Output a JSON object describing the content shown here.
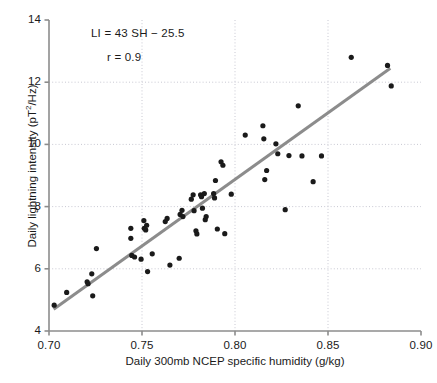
{
  "chart_data": {
    "type": "scatter",
    "title": "",
    "xlabel": "Daily 300mb NCEP specific humidity (g/kg)",
    "ylabel": "Daily lightning intensity (pT²/Hz)",
    "ylabel_main": "Daily lightning intensity (pT",
    "ylabel_sup": "2",
    "ylabel_tail": "/Hz)",
    "xlim": [
      0.7,
      0.9
    ],
    "ylim": [
      4,
      14
    ],
    "xticks": [
      0.7,
      0.75,
      0.8,
      0.85,
      0.9
    ],
    "xtick_labels": [
      "0.70",
      "0.75",
      "0.80",
      "0.85",
      "0.90"
    ],
    "yticks": [
      4,
      6,
      8,
      10,
      12,
      14
    ],
    "ytick_labels": [
      "4",
      "6",
      "8",
      "10",
      "12",
      "14"
    ],
    "grid": true,
    "grid_style": "dotted",
    "legend": "none",
    "annotations": [
      {
        "text": "LI = 43 SH − 25.5",
        "x": 0.745,
        "y": 13.3
      },
      {
        "text": "r = 0.9",
        "x": 0.754,
        "y": 12.5
      }
    ],
    "fit_line": {
      "equation": "LI = 43 SH − 25.5",
      "slope": 43,
      "intercept": -25.5,
      "correlation": 0.9,
      "x_start": 0.7025,
      "y_start": 4.7,
      "x_end": 0.8835,
      "y_end": 12.45,
      "color": "#8c8c8c",
      "width": 3
    },
    "point_color": "#1a1a1a",
    "point_radius": 2.6,
    "points": [
      {
        "x": 0.7028,
        "y": 4.83
      },
      {
        "x": 0.7095,
        "y": 5.24
      },
      {
        "x": 0.7205,
        "y": 5.58
      },
      {
        "x": 0.721,
        "y": 5.52
      },
      {
        "x": 0.723,
        "y": 5.84
      },
      {
        "x": 0.7235,
        "y": 5.13
      },
      {
        "x": 0.7255,
        "y": 6.65
      },
      {
        "x": 0.744,
        "y": 7.3
      },
      {
        "x": 0.7445,
        "y": 6.43
      },
      {
        "x": 0.744,
        "y": 6.98
      },
      {
        "x": 0.746,
        "y": 6.38
      },
      {
        "x": 0.7495,
        "y": 6.31
      },
      {
        "x": 0.751,
        "y": 7.55
      },
      {
        "x": 0.7512,
        "y": 7.3
      },
      {
        "x": 0.752,
        "y": 7.25
      },
      {
        "x": 0.7525,
        "y": 7.4
      },
      {
        "x": 0.753,
        "y": 5.91
      },
      {
        "x": 0.7555,
        "y": 6.48
      },
      {
        "x": 0.7625,
        "y": 7.52
      },
      {
        "x": 0.7635,
        "y": 7.62
      },
      {
        "x": 0.765,
        "y": 6.12
      },
      {
        "x": 0.77,
        "y": 6.34
      },
      {
        "x": 0.7705,
        "y": 7.75
      },
      {
        "x": 0.7715,
        "y": 7.88
      },
      {
        "x": 0.772,
        "y": 7.68
      },
      {
        "x": 0.7765,
        "y": 8.24
      },
      {
        "x": 0.7775,
        "y": 8.38
      },
      {
        "x": 0.778,
        "y": 7.87
      },
      {
        "x": 0.779,
        "y": 7.22
      },
      {
        "x": 0.7795,
        "y": 7.12
      },
      {
        "x": 0.7815,
        "y": 8.38
      },
      {
        "x": 0.782,
        "y": 8.32
      },
      {
        "x": 0.7825,
        "y": 7.95
      },
      {
        "x": 0.7835,
        "y": 8.42
      },
      {
        "x": 0.784,
        "y": 7.58
      },
      {
        "x": 0.7845,
        "y": 7.68
      },
      {
        "x": 0.7885,
        "y": 8.42
      },
      {
        "x": 0.789,
        "y": 8.28
      },
      {
        "x": 0.7895,
        "y": 8.84
      },
      {
        "x": 0.7905,
        "y": 7.28
      },
      {
        "x": 0.7925,
        "y": 9.44
      },
      {
        "x": 0.7935,
        "y": 9.33
      },
      {
        "x": 0.7945,
        "y": 7.13
      },
      {
        "x": 0.798,
        "y": 8.4
      },
      {
        "x": 0.8055,
        "y": 10.3
      },
      {
        "x": 0.815,
        "y": 10.6
      },
      {
        "x": 0.8155,
        "y": 10.18
      },
      {
        "x": 0.816,
        "y": 8.87
      },
      {
        "x": 0.817,
        "y": 9.16
      },
      {
        "x": 0.822,
        "y": 10.02
      },
      {
        "x": 0.823,
        "y": 9.7
      },
      {
        "x": 0.827,
        "y": 7.9
      },
      {
        "x": 0.829,
        "y": 9.64
      },
      {
        "x": 0.834,
        "y": 11.24
      },
      {
        "x": 0.836,
        "y": 9.63
      },
      {
        "x": 0.842,
        "y": 8.8
      },
      {
        "x": 0.8465,
        "y": 9.63
      },
      {
        "x": 0.8625,
        "y": 12.8
      },
      {
        "x": 0.882,
        "y": 12.54
      },
      {
        "x": 0.884,
        "y": 11.88
      }
    ]
  },
  "axes": {
    "axis_color": "#8c8c8c",
    "grid_color": "#c8c8d2",
    "text_color": "#1a1a1a"
  }
}
